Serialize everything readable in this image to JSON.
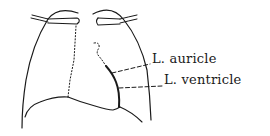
{
  "diagram": {
    "labels": [
      {
        "id": "l-auricle",
        "text": "L. auricle"
      },
      {
        "id": "l-ventricle",
        "text": "L. ventricle"
      }
    ],
    "colors": {
      "stroke": "#1a1a1a",
      "background": "#ffffff"
    }
  }
}
